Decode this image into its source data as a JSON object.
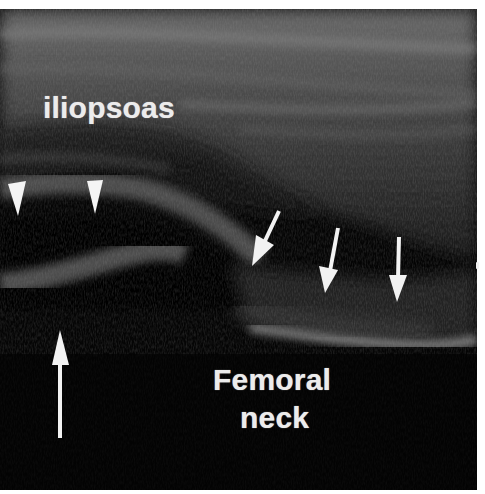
{
  "figure": {
    "type": "ultrasound-scan",
    "modality": "grayscale B-mode ultrasound",
    "background_color": "#050505",
    "annotation_color": "#f2f2f2",
    "labels": {
      "muscle": "iliopsoas",
      "bone_line1": "Femoral",
      "bone_line2": "neck"
    },
    "annotations": {
      "arrowheads": [
        {
          "name": "arrowhead-left",
          "tip": [
            17,
            207
          ],
          "direction": "down"
        },
        {
          "name": "arrowhead-right",
          "tip": [
            96,
            205
          ],
          "direction": "down"
        }
      ],
      "diagonal_arrows": [
        {
          "name": "arrow-1",
          "tail": [
            279,
            202
          ],
          "tip": [
            252,
            257
          ]
        },
        {
          "name": "arrow-2",
          "tail": [
            338,
            219
          ],
          "tip": [
            325,
            284
          ]
        },
        {
          "name": "arrow-3",
          "tail": [
            399,
            228
          ],
          "tip": [
            397,
            293
          ]
        }
      ],
      "vertical_arrow": {
        "name": "arrow-up",
        "tail": [
          60,
          429
        ],
        "tip": [
          60,
          321
        ],
        "direction": "up"
      }
    }
  }
}
